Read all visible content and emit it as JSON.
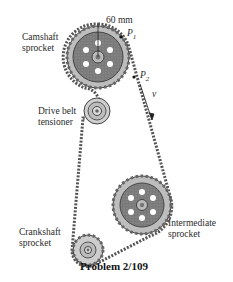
{
  "figure": {
    "caption": "Problem 2/109",
    "labels": {
      "camshaft": "Camshaft\nsprocket",
      "dimension": "60 mm",
      "p1": "P",
      "p1_sub": "1",
      "p2": "P",
      "p2_sub": "2",
      "velocity": "v",
      "tensioner": "Drive belt\ntensioner",
      "intermediate": "Intermediate\nsprocket",
      "crankshaft": "Crankshaft\nsprocket"
    }
  }
}
